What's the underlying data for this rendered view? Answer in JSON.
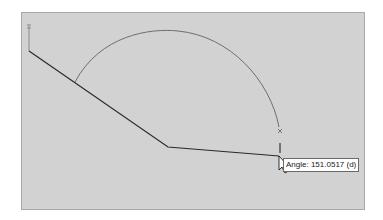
{
  "canvas": {
    "background": "#d2d2d2",
    "line_color": "#2a2a2a",
    "arc_color": "#6e6e6e"
  },
  "tooltip": {
    "text": "Angle: 151.0517 (d)"
  },
  "icons": {
    "cursor": "arrow-cursor-icon",
    "start_marker": "endpoint-marker-icon",
    "arc_end_marker": "endpoint-marker-icon"
  }
}
